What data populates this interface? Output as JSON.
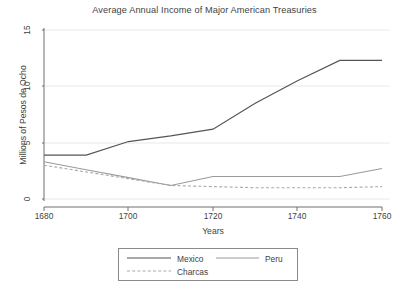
{
  "chart_data": {
    "type": "line",
    "title": "Average Annual Income of Major American Treasuries",
    "xlabel": "Years",
    "ylabel": "Millions of Pesos de Ocho",
    "xlim": [
      1680,
      1760
    ],
    "ylim": [
      0,
      15
    ],
    "xticks": [
      "1680",
      "1700",
      "1720",
      "1740",
      "1760"
    ],
    "yticks": [
      "0",
      "5",
      "10",
      "15"
    ],
    "grid": "horizontal",
    "legend_position": "below-plot",
    "x": [
      1680,
      1690,
      1700,
      1710,
      1720,
      1730,
      1740,
      1750,
      1760
    ],
    "series": [
      {
        "name": "Mexico",
        "style": "solid",
        "color": "#555555",
        "values": [
          3.9,
          3.9,
          5.1,
          5.6,
          6.2,
          8.5,
          10.5,
          12.3,
          12.3
        ]
      },
      {
        "name": "Peru",
        "style": "solid",
        "color": "#9a9a9a",
        "values": [
          3.3,
          2.6,
          1.9,
          1.2,
          2.0,
          2.0,
          2.0,
          2.0,
          2.7
        ]
      },
      {
        "name": "Charcas",
        "style": "dashed",
        "color": "#a8a8a8",
        "values": [
          3.0,
          2.4,
          1.8,
          1.2,
          1.1,
          1.0,
          1.0,
          1.0,
          1.1
        ]
      }
    ]
  },
  "axis": {
    "ytick_0": "0",
    "ytick_5": "5",
    "ytick_10": "10",
    "ytick_15": "15",
    "xtick_1680": "1680",
    "xtick_1700": "1700",
    "xtick_1720": "1720",
    "xtick_1740": "1740",
    "xtick_1760": "1760",
    "xlabel": "Years",
    "ylabel": "Millions of Pesos de Ocho"
  },
  "legend": {
    "mexico": "Mexico",
    "peru": "Peru",
    "charcas": "Charcas"
  },
  "header": {
    "title": "Average Annual Income of Major American Treasuries"
  }
}
